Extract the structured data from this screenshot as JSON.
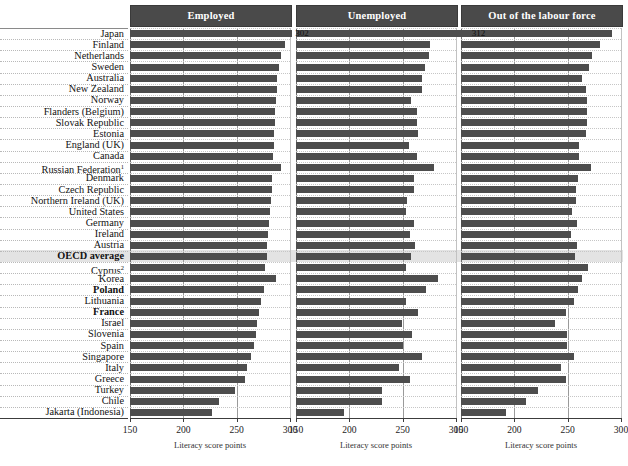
{
  "chart_data": {
    "type": "bar",
    "title": "",
    "xlabel": "Literacy score points",
    "ylabel": "",
    "xlim": [
      150,
      300
    ],
    "xticks": [
      150,
      200,
      250,
      300
    ],
    "grid": true,
    "orientation": "horizontal",
    "panels": [
      {
        "name": "employed",
        "label": "Employed",
        "axis_title": "Literacy score points"
      },
      {
        "name": "unemployed",
        "label": "Unemployed",
        "axis_title": "Literacy score points"
      },
      {
        "name": "out_of_labour_force",
        "label": "Out of the labour force",
        "axis_title": "Literacy score points"
      }
    ],
    "categories": [
      "Japan",
      "Finland",
      "Netherlands",
      "Sweden",
      "Australia",
      "New Zealand",
      "Norway",
      "Flanders (Belgium)",
      "Slovak Republic",
      "Estonia",
      "England (UK)",
      "Canada",
      "Russian Federation",
      "Denmark",
      "Czech Republic",
      "Northern Ireland (UK)",
      "United States",
      "Germany",
      "Ireland",
      "Austria",
      "OECD average",
      "Cyprus",
      "Korea",
      "Poland",
      "Lithuania",
      "France",
      "Israel",
      "Slovenia",
      "Spain",
      "Singapore",
      "Italy",
      "Greece",
      "Turkey",
      "Chile",
      "Jakarta (Indonesia)"
    ],
    "category_footnotes": {
      "Russian Federation": "1",
      "Cyprus": "2"
    },
    "bold_categories": [
      "OECD average",
      "Poland",
      "France"
    ],
    "highlight_category": "OECD average",
    "series": [
      {
        "name": "Employed",
        "values": [
          302,
          295,
          292,
          290,
          288,
          288,
          287,
          286,
          286,
          285,
          285,
          284,
          292,
          283,
          283,
          282,
          281,
          280,
          279,
          278,
          278,
          277,
          287,
          276,
          273,
          271,
          269,
          268,
          266,
          263,
          260,
          258,
          248,
          233,
          227
        ]
      },
      {
        "name": "Unemployed",
        "values": [
          312,
          276,
          275,
          271,
          268,
          268,
          258,
          263,
          263,
          264,
          256,
          263,
          279,
          261,
          261,
          254,
          253,
          261,
          257,
          262,
          258,
          253,
          283,
          272,
          253,
          264,
          249,
          259,
          250,
          268,
          247,
          257,
          231,
          231,
          195
        ]
      },
      {
        "name": "Out of the labour force",
        "values": [
          292,
          280,
          273,
          270,
          263,
          267,
          268,
          268,
          268,
          267,
          261,
          261,
          272,
          260,
          258,
          258,
          254,
          259,
          253,
          259,
          257,
          269,
          263,
          260,
          256,
          248,
          238,
          249,
          249,
          256,
          244,
          248,
          222,
          211,
          192
        ]
      }
    ]
  }
}
